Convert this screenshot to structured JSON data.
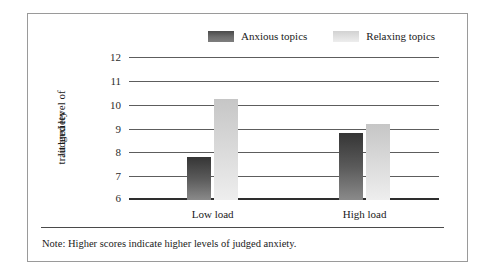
{
  "chart_data": {
    "type": "bar",
    "title": "",
    "xlabel": "",
    "ylabel": "Judged level of trait anxiety",
    "ylabel_lines": [
      "Judged level of",
      "trait anxiety"
    ],
    "categories": [
      "Low load",
      "High load"
    ],
    "series": [
      {
        "name": "Anxious topics",
        "values": [
          7.8,
          8.8
        ],
        "color": "#4a4a4a"
      },
      {
        "name": "Relaxing topics",
        "values": [
          10.25,
          9.2
        ],
        "color": "#dcdcdc"
      }
    ],
    "ylim": [
      6,
      12
    ],
    "yticks": [
      "12",
      "11",
      "10",
      "9",
      "8",
      "7",
      "6"
    ],
    "ytick_values": [
      12,
      11,
      10,
      9,
      8,
      7,
      6
    ],
    "grid": true,
    "legend_position": "top-right",
    "note": "Note: Higher scores indicate higher levels of judged anxiety."
  },
  "legend": {
    "items": [
      {
        "label": "Anxious topics"
      },
      {
        "label": "Relaxing topics"
      }
    ]
  },
  "axis": {
    "y_title_line1": "Judged level of",
    "y_title_line2": "trait anxiety",
    "x_categories": [
      "Low load",
      "High load"
    ]
  },
  "footer": {
    "note": "Note: Higher scores indicate higher levels of judged anxiety."
  }
}
